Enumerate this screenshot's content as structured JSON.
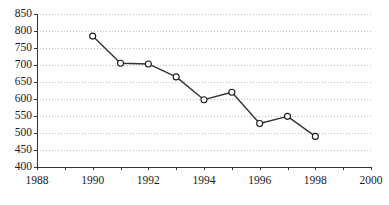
{
  "chart_data": {
    "type": "line",
    "title": "",
    "subtitle": "",
    "xlabel": "",
    "ylabel": "",
    "x": [
      1990,
      1991,
      1992,
      1993,
      1994,
      1995,
      1996,
      1997,
      1998
    ],
    "values": [
      785,
      705,
      703,
      665,
      598,
      620,
      528,
      549,
      490
    ],
    "series": [
      {
        "name": "series-1",
        "x": [
          1990,
          1991,
          1992,
          1993,
          1994,
          1995,
          1996,
          1997,
          1998
        ],
        "values": [
          785,
          705,
          703,
          665,
          598,
          620,
          528,
          549,
          490
        ]
      }
    ],
    "xlim": [
      1988,
      2000
    ],
    "ylim": [
      400,
      850
    ],
    "yticks": [
      400,
      450,
      500,
      550,
      600,
      650,
      700,
      750,
      800,
      850
    ],
    "ytick_labels": [
      "400",
      "450",
      "500",
      "550",
      "600",
      "650",
      "700",
      "750",
      "800",
      "850"
    ],
    "xticks": [
      1988,
      1989,
      1990,
      1991,
      1992,
      1993,
      1994,
      1995,
      1996,
      1997,
      1998,
      1999,
      2000
    ],
    "xtick_labels": [
      "1988",
      "",
      "1990",
      "",
      "1992",
      "",
      "1994",
      "",
      "1996",
      "",
      "1998",
      "",
      "2000"
    ],
    "xtick_labels_shown": [
      "1988",
      "1990",
      "1992",
      "1994",
      "1996",
      "1998",
      "2000"
    ],
    "grid": true,
    "grid_axis": "y",
    "grid_style": "dotted",
    "legend": false,
    "legend_position": "none",
    "marker": "open-circle",
    "annotations": []
  },
  "style": {
    "line_color": "#333333",
    "marker_face_color": "#ffffff",
    "marker_edge_color": "#1a1a1a",
    "grid_color": "#bdbdbd",
    "axis_color": "#333333",
    "text_color": "#1a1a1a",
    "background": "#ffffff"
  },
  "geometry": {
    "plot_left": 37,
    "plot_right": 371,
    "plot_top": 14,
    "plot_bottom": 167,
    "width": 389,
    "height": 205
  }
}
